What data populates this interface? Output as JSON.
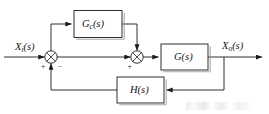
{
  "diagram": {
    "type": "control-block-diagram",
    "stroke_color": "#1a1a1a",
    "block_fill": "#ffffff",
    "block_shadow_color": "#9a9a9a",
    "background": "#ffffff"
  },
  "signals": {
    "input": {
      "base": "X",
      "subscript": "i",
      "arg": "(s)",
      "full": "Xi(s)"
    },
    "output": {
      "base": "X",
      "subscript": "o",
      "arg": "(s)",
      "full": "Xo(s)"
    }
  },
  "blocks": {
    "compensator": {
      "base": "G",
      "subscript": "c",
      "arg": "(s)",
      "full": "Gc(s)"
    },
    "plant": {
      "base": "G",
      "subscript": "",
      "arg": "(s)",
      "full": "G(s)"
    },
    "feedback": {
      "base": "H",
      "subscript": "",
      "arg": "(s)",
      "full": "H(s)"
    }
  },
  "summers": {
    "first": {
      "plus": "+",
      "minus": "−"
    },
    "second": {
      "plus": "+"
    }
  }
}
